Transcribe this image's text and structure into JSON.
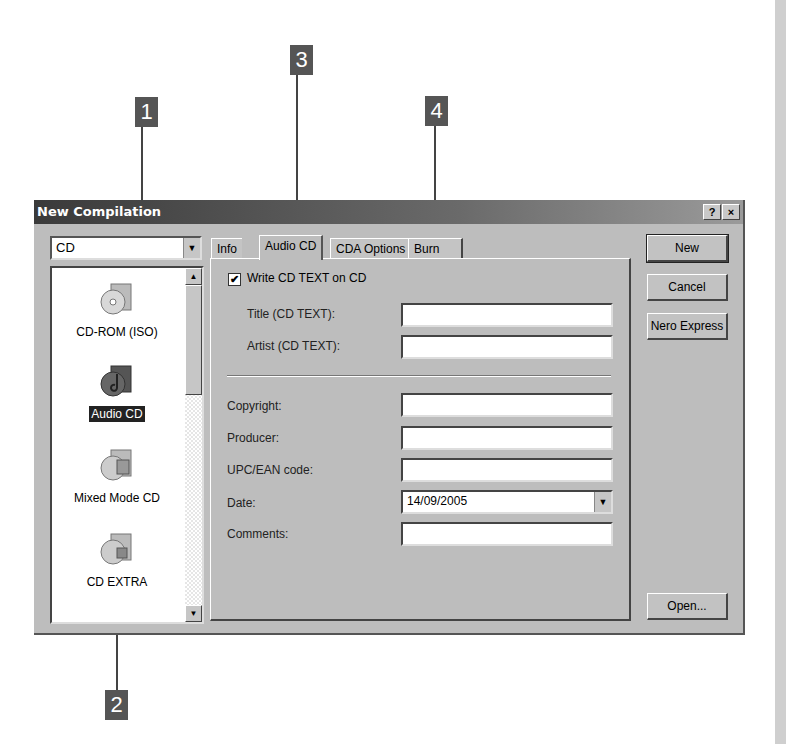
{
  "callouts": [
    {
      "number": "1"
    },
    {
      "number": "2"
    },
    {
      "number": "3"
    },
    {
      "number": "4"
    }
  ],
  "dialog": {
    "title": "New Compilation",
    "help_label": "?",
    "close_label": "×",
    "media_combo": {
      "value": "CD",
      "arrow": "▼"
    },
    "compilation_list": [
      {
        "label": "CD-ROM (ISO)",
        "icon": "cd-rom-iso-icon",
        "selected": false
      },
      {
        "label": "Audio CD",
        "icon": "audio-cd-icon",
        "selected": true
      },
      {
        "label": "Mixed Mode CD",
        "icon": "mixed-mode-cd-icon",
        "selected": false
      },
      {
        "label": "CD EXTRA",
        "icon": "cd-extra-icon",
        "selected": false
      }
    ],
    "scroll": {
      "up": "▲",
      "down": "▼"
    },
    "tabs": [
      {
        "label": "Info",
        "active": false
      },
      {
        "label": "Audio CD",
        "active": true
      },
      {
        "label": "CDA Options",
        "active": false
      },
      {
        "label": "Burn",
        "active": false
      }
    ],
    "audio_cd_tab": {
      "write_cd_text": {
        "label": "Write CD TEXT on CD",
        "checked": true,
        "mark": "✔"
      },
      "title_label": "Title (CD TEXT):",
      "title_value": "",
      "artist_label": "Artist (CD TEXT):",
      "artist_value": "",
      "copyright_label": "Copyright:",
      "copyright_value": "",
      "producer_label": "Producer:",
      "producer_value": "",
      "upc_label": "UPC/EAN code:",
      "upc_value": "",
      "date_label": "Date:",
      "date_value": "14/09/2005",
      "date_arrow": "▼",
      "comments_label": "Comments:",
      "comments_value": ""
    },
    "buttons": {
      "new": "New",
      "cancel": "Cancel",
      "nero_express": "Nero Express",
      "open": "Open..."
    }
  }
}
